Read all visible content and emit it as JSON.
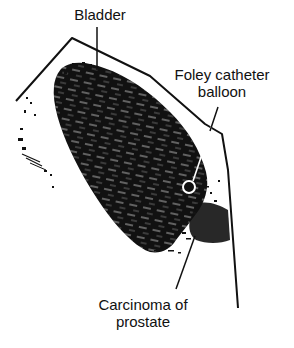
{
  "figure": {
    "type": "ultrasound schematic drawing",
    "colors": {
      "ink": "#111111",
      "background": "#ffffff"
    }
  },
  "labels": {
    "bladder": "Bladder",
    "foley_line1": "Foley catheter",
    "foley_line2": "balloon",
    "carcinoma_line1": "Carcinoma of",
    "carcinoma_line2": "prostate"
  }
}
